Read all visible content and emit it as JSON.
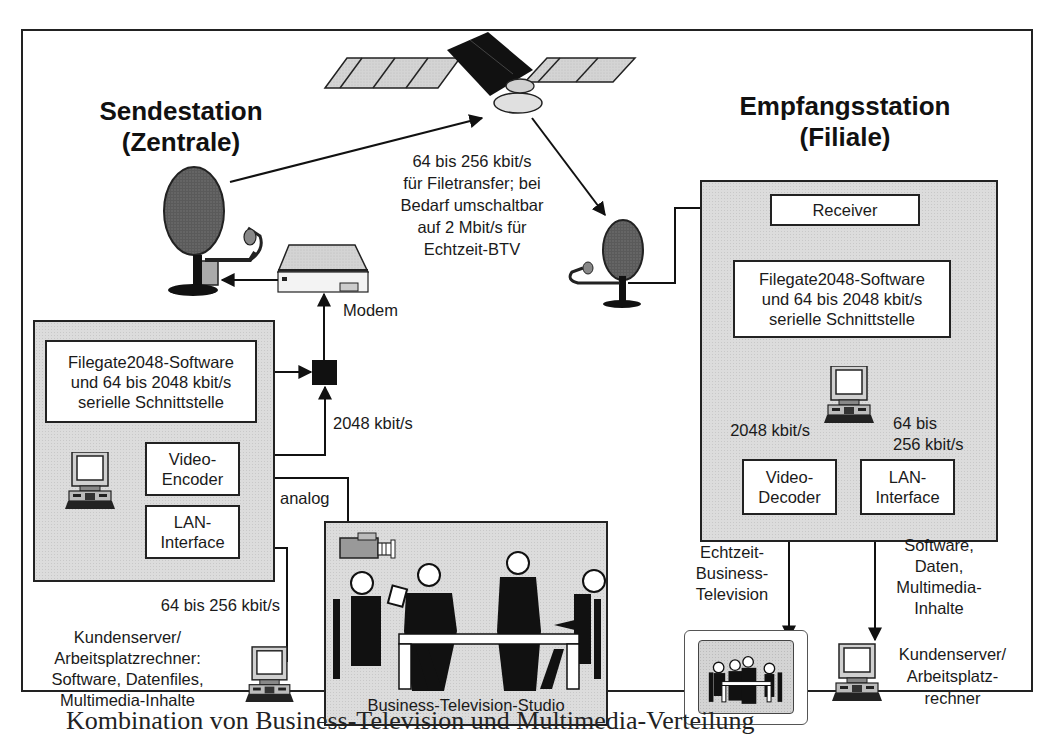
{
  "sender": {
    "title_line1": "Sendestation",
    "title_line2": "(Zentrale)",
    "modem_label": "Modem",
    "filegate_box": [
      "Filegate2048-Software",
      "und 64 bis 2048 kbit/s",
      "serielle Schnittstelle"
    ],
    "video_encoder_box": [
      "Video-",
      "Encoder"
    ],
    "lan_interface_box": [
      "LAN-",
      "Interface"
    ],
    "rate_2048": "2048 kbit/s",
    "analog_label": "analog",
    "rate_lan": "64 bis 256 kbit/s",
    "client_label": [
      "Kundenserver/",
      "Arbeitsplatzrechner:",
      "Software, Datenfiles,",
      "Multimedia-Inhalte"
    ]
  },
  "satellite_link": {
    "label": [
      "64 bis 256 kbit/s",
      "für Filetransfer; bei",
      "Bedarf umschaltbar",
      "auf 2 Mbit/s für",
      "Echtzeit-BTV"
    ]
  },
  "studio": {
    "label": "Business-Television-Studio"
  },
  "receiver": {
    "title_line1": "Empfangsstation",
    "title_line2": "(Filiale)",
    "receiver_box": "Receiver",
    "filegate_box": [
      "Filegate2048-Software",
      "und 64 bis 2048 kbit/s",
      "serielle Schnittstelle"
    ],
    "rate_video": "2048 kbit/s",
    "rate_lan": [
      "64 bis",
      "256 kbit/s"
    ],
    "video_decoder_box": [
      "Video-",
      "Decoder"
    ],
    "lan_interface_box": [
      "LAN-",
      "Interface"
    ],
    "btv_label": [
      "Echtzeit-",
      "Business-",
      "Television"
    ],
    "content_label": [
      "Software,",
      "Daten,",
      "Multimedia-",
      "Inhalte"
    ],
    "client_label": [
      "Kundenserver/",
      "Arbeitsplatz-",
      "rechner"
    ]
  },
  "caption": "Kombination von Business-Television und Multimedia-Verteilung"
}
